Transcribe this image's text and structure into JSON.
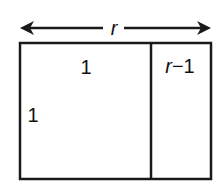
{
  "diagram": {
    "width_label": "r",
    "left_region_top_label": "1",
    "left_region_side_label": "1",
    "right_region_top_label": "r−1",
    "colors": {
      "stroke": "#1a1a1a",
      "background": "#ffffff"
    }
  }
}
